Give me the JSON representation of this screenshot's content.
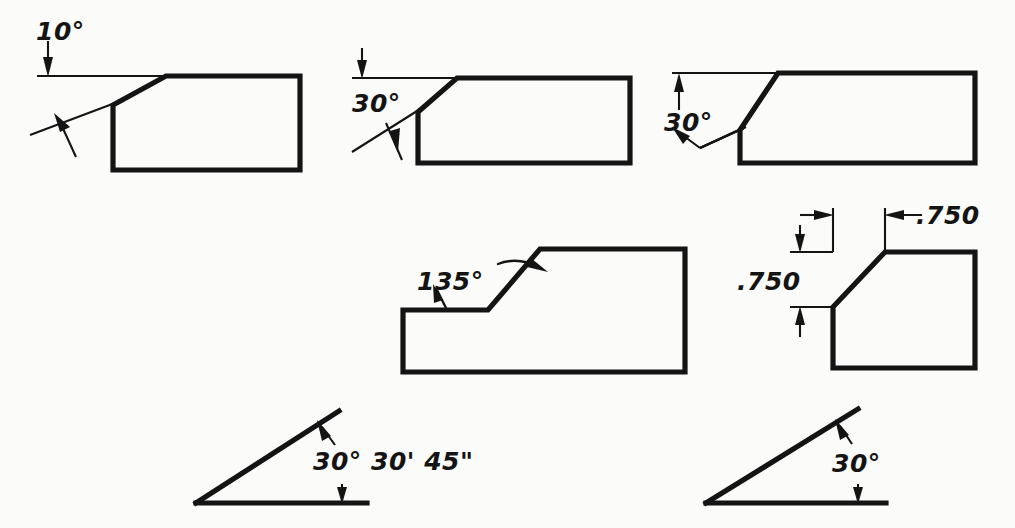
{
  "drawing": {
    "title": "Angular dimensioning examples",
    "background_color": "#fbfbfa",
    "line_color": "#141414",
    "figures": [
      {
        "id": "fig-10-deg-chamfer",
        "name": "block-with-10-degree-chamfer",
        "label": "10°",
        "description": "Rectangular block with shallow chamfer, angle dimensioned from horizontal extension line"
      },
      {
        "id": "fig-30-deg-chamfer-left-label",
        "name": "block-with-30-degree-chamfer-left-label",
        "label": "30°",
        "description": "Rectangular block with 30 degree chamfer, label at left of extension lines"
      },
      {
        "id": "fig-30-deg-chamfer-vee",
        "name": "block-with-30-degree-chamfer-vee-arrows",
        "label": "30°",
        "description": "Rectangular block with 30 degree chamfer, vee shaped extension lines"
      },
      {
        "id": "fig-135-deg-step",
        "name": "stepped-block-135-degree",
        "label": "135°",
        "description": "Stepped block with 135 degree angled face and curved leader"
      },
      {
        "id": "fig-750-chamfer",
        "name": "block-with-750-chamfer",
        "label_horizontal": ".750",
        "label_vertical": ".750",
        "description": "Block with chamfer dimensioned by two linear .750 dimensions"
      },
      {
        "id": "fig-30-30-45",
        "name": "triangle-30-deg-30-min-45-sec",
        "label": "30° 30' 45\"",
        "description": "Triangle with angle dimensioned in degrees, minutes and seconds"
      },
      {
        "id": "fig-30-deg-triangle",
        "name": "triangle-30-degree",
        "label": "30°",
        "description": "Triangle with angle dimensioned in whole degrees"
      }
    ]
  }
}
